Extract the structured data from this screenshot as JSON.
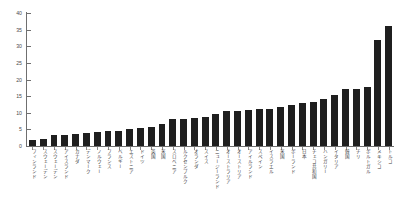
{
  "chart_data": {
    "type": "bar",
    "title": "",
    "xlabel": "",
    "ylabel": "",
    "ylim": [
      0,
      40
    ],
    "yticks": [
      0,
      5,
      10,
      15,
      20,
      25,
      30,
      35,
      40
    ],
    "grid": false,
    "legend": null,
    "bar_color": "#1f1f1f",
    "axis_color": "#6f6f6f",
    "categories": [
      "フィンランド",
      "スウェーデン",
      "スウェーデン",
      "アイスランド",
      "カナダ",
      "デンマーク",
      "ノルウェー",
      "フランス",
      "ベルギー",
      "エストニア",
      "ドイツ",
      "英国",
      "米国",
      "スロベニア",
      "ルクセンブルク",
      "オランダ",
      "スイス",
      "ニュージーランド",
      "オーストラリア",
      "オーストリア",
      "アイルランド",
      "スペイン",
      "イスラエル",
      "米国",
      "ポーランド",
      "日本",
      "チェコ共和国",
      "ハンガリー",
      "イタリア",
      "韓国",
      "チリ",
      "ポルトガル",
      "メキシコ",
      "トルコ"
    ],
    "values": [
      1.8,
      2.0,
      3.2,
      3.4,
      3.6,
      4.0,
      4.2,
      4.4,
      4.6,
      5.0,
      5.4,
      5.6,
      6.6,
      8.0,
      8.2,
      8.4,
      8.6,
      9.6,
      10.4,
      10.6,
      10.8,
      11.0,
      11.2,
      11.6,
      12.2,
      13.0,
      13.2,
      14.0,
      15.2,
      17.0,
      17.2,
      17.6,
      32.0,
      36.0
    ]
  }
}
